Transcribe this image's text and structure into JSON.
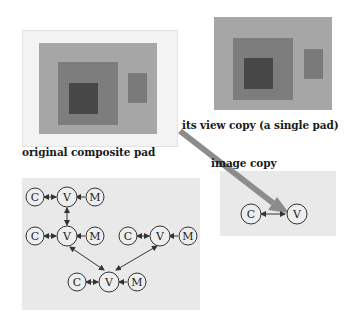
{
  "labels": {
    "original": "original composite pad",
    "view_copy": "its view copy (a single pad)",
    "image_copy": "image copy"
  },
  "colors": {
    "frame": "#f3f3f3",
    "frame_border": "#e4e4e4",
    "outer_rect": "#a6a6a6",
    "middle_rect": "#7d7d7d",
    "inner_rect": "#474747",
    "side_rect": "#7a7a7a",
    "diagram_bg": "#e9e9e9",
    "arrow": "#8c8c8c",
    "node_stroke": "#333333"
  },
  "diagram": {
    "nodes": [
      {
        "id": "c1",
        "label": "C"
      },
      {
        "id": "v1",
        "label": "V"
      },
      {
        "id": "m1",
        "label": "M"
      },
      {
        "id": "c2",
        "label": "C"
      },
      {
        "id": "v2",
        "label": "V"
      },
      {
        "id": "m2",
        "label": "M"
      },
      {
        "id": "c3",
        "label": "C"
      },
      {
        "id": "v3",
        "label": "V"
      },
      {
        "id": "m3",
        "label": "M"
      },
      {
        "id": "c4",
        "label": "C"
      },
      {
        "id": "v4",
        "label": "V"
      },
      {
        "id": "m4",
        "label": "M"
      }
    ],
    "edges": [
      [
        "c1",
        "v1",
        "both"
      ],
      [
        "m1",
        "v1",
        "to"
      ],
      [
        "v1",
        "v2",
        "both"
      ],
      [
        "c2",
        "v2",
        "both"
      ],
      [
        "m2",
        "v2",
        "to"
      ],
      [
        "c3",
        "v3",
        "both"
      ],
      [
        "m3",
        "v3",
        "to"
      ],
      [
        "v2",
        "v4",
        "both"
      ],
      [
        "v3",
        "v4",
        "both"
      ],
      [
        "c4",
        "v4",
        "both"
      ],
      [
        "m4",
        "v4",
        "to"
      ]
    ]
  },
  "image_copy": {
    "nodes": [
      {
        "id": "ic",
        "label": "C"
      },
      {
        "id": "iv",
        "label": "V"
      }
    ],
    "edges": [
      [
        "ic",
        "iv",
        "both"
      ]
    ]
  }
}
